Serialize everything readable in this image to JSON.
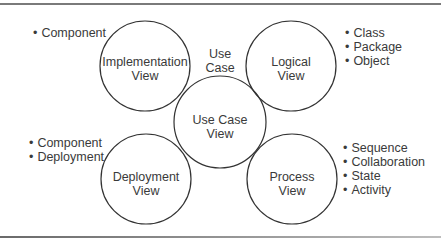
{
  "diagram": {
    "views": [
      {
        "id": "implementation",
        "line1": "Implementation",
        "line2": "View",
        "cx": 145,
        "cy": 66,
        "r": 45
      },
      {
        "id": "logical",
        "line1": "Logical",
        "line2": "View",
        "cx": 291,
        "cy": 66,
        "r": 45
      },
      {
        "id": "use-case",
        "line1": "Use Case",
        "line2": "View",
        "cx": 220,
        "cy": 122,
        "r": 46
      },
      {
        "id": "deployment",
        "line1": "Deployment",
        "line2": "View",
        "cx": 146,
        "cy": 179,
        "r": 45
      },
      {
        "id": "process",
        "line1": "Process",
        "line2": "View",
        "cx": 292,
        "cy": 179,
        "r": 45
      }
    ],
    "use_case_caption": {
      "line1": "Use",
      "line2": "Case"
    },
    "bullet_groups": {
      "implementation": [
        "Component"
      ],
      "logical": [
        "Class",
        "Package",
        "Object"
      ],
      "deployment": [
        "Component",
        "Deployment"
      ],
      "process": [
        "Sequence",
        "Collaboration",
        "State",
        "Activity"
      ]
    },
    "colors": {
      "stroke": "#333333",
      "text": "#3a3a3a",
      "rule": "#7a7a7a"
    }
  }
}
